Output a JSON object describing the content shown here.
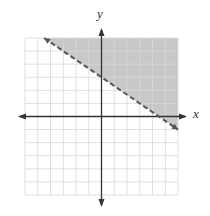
{
  "chart_data": {
    "type": "line",
    "title": "",
    "xlabel": "x",
    "ylabel": "y",
    "xlim": [
      -6,
      6
    ],
    "ylim": [
      -6,
      6
    ],
    "grid": true,
    "grid_step": 1,
    "series": [
      {
        "name": "boundary",
        "equation": "y = -2/3 x + 3",
        "style": "dashed",
        "x": [
          -4.5,
          6
        ],
        "y": [
          6,
          -1
        ]
      }
    ],
    "shaded_region": "above boundary line (y > -2/3 x + 3)",
    "shade_color": "#c8c8c8",
    "line_color": "#555555",
    "grid_color": "#d8d8d8",
    "axis_color": "#333333"
  },
  "labels": {
    "x_axis": "x",
    "y_axis": "y"
  }
}
